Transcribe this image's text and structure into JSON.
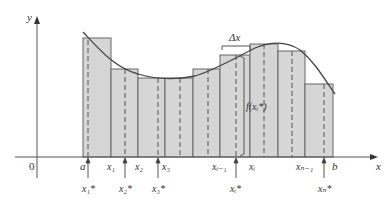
{
  "diagram": {
    "axes": {
      "x_label": "x",
      "y_label": "y",
      "origin_label": "0"
    },
    "interval": {
      "a_label": "a",
      "b_label": "b"
    },
    "partition_labels": [
      "x₁",
      "x₂",
      "x₃",
      "xᵢ₋₁",
      "xᵢ",
      "xₙ₋₁"
    ],
    "sample_labels": {
      "x1": "x₁*",
      "x2": "x₂*",
      "x3": "x₃*",
      "xi": "xᵢ*",
      "xn": "xₙ*"
    },
    "annotations": {
      "delta_x": "Δx",
      "height": "f(xᵢ*)"
    },
    "colors": {
      "bar_fill": "#d6d6d6",
      "bar_stroke": "#555555",
      "curve": "#444444",
      "axis": "#555555"
    },
    "bars": [
      {
        "x0": 83,
        "x1": 111,
        "top": 38
      },
      {
        "x0": 111,
        "x1": 138,
        "top": 69
      },
      {
        "x0": 138,
        "x1": 165,
        "top": 78
      },
      {
        "x0": 165,
        "x1": 193,
        "top": 78
      },
      {
        "x0": 193,
        "x1": 220,
        "top": 69
      },
      {
        "x0": 220,
        "x1": 250,
        "top": 55
      },
      {
        "x0": 250,
        "x1": 278,
        "top": 44
      },
      {
        "x0": 278,
        "x1": 305,
        "top": 51
      },
      {
        "x0": 305,
        "x1": 333,
        "top": 84
      }
    ]
  }
}
